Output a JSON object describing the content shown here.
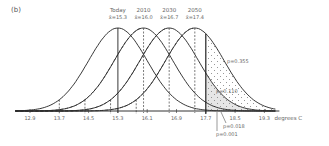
{
  "chart_data": {
    "type": "line",
    "panel_label": "(b)",
    "title": "",
    "xlabel": "degrees C",
    "ylabel": "",
    "x_ticks": [
      "12.9",
      "13.7",
      "14.5",
      "15.3",
      "16.1",
      "16.9",
      "17.7",
      "18.5",
      "19.3"
    ],
    "x_tick_values": [
      12.9,
      13.7,
      14.5,
      15.3,
      16.1,
      16.9,
      17.7,
      18.5,
      19.3
    ],
    "xlim": [
      12.5,
      19.6
    ],
    "grid": false,
    "distribution": "normal",
    "std_dev": 0.8,
    "threshold": 17.7,
    "series": [
      {
        "name": "Today",
        "mean_label": "x̄=15.3",
        "mean": 15.3,
        "style": "solid",
        "p_exceed": "p=0.001"
      },
      {
        "name": "2010",
        "mean_label": "x̄=16.0",
        "mean": 16.0,
        "style": "solid",
        "p_exceed": "p=0.018"
      },
      {
        "name": "2030",
        "mean_label": "x̄=16.7",
        "mean": 16.7,
        "style": "solid",
        "p_exceed": "p=0.110"
      },
      {
        "name": "2050",
        "mean_label": "x̄=17.4",
        "mean": 17.4,
        "style": "solid",
        "p_exceed": "p=0.355"
      }
    ],
    "annotations": [
      "p=0.355",
      "p=0.110",
      "p=0.018",
      "p=0.001"
    ]
  }
}
